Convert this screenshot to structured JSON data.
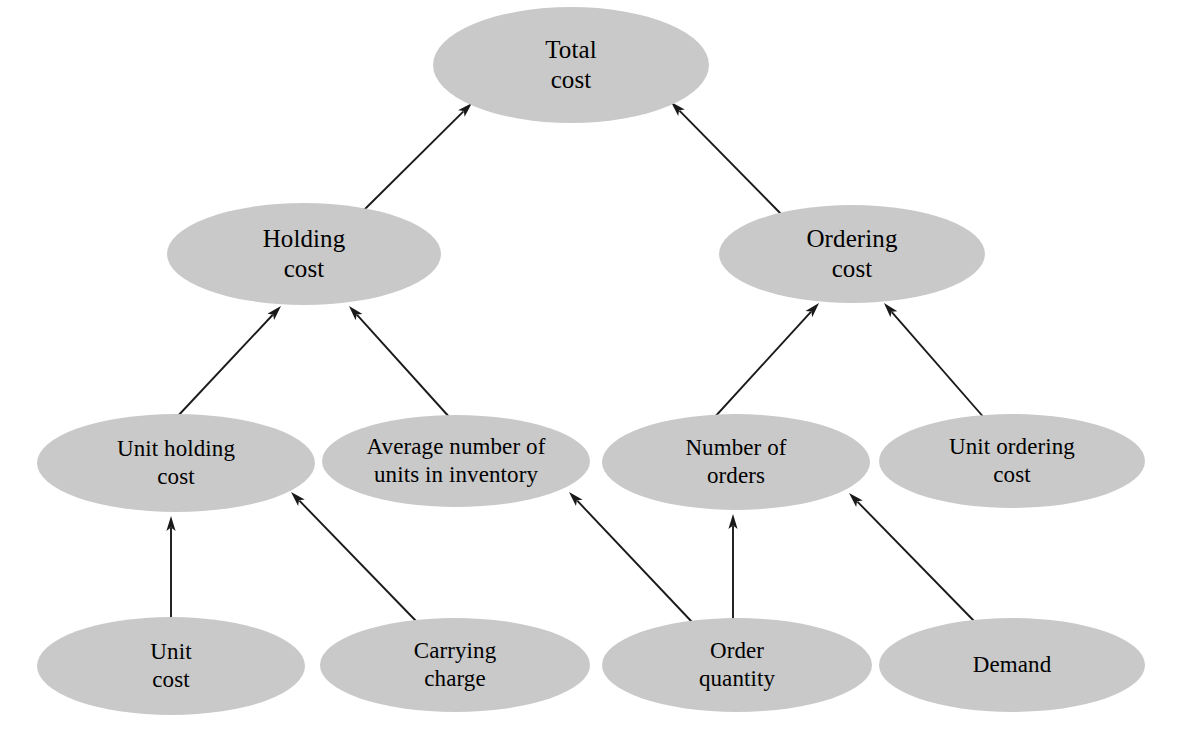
{
  "diagram": {
    "type": "hierarchy-tree",
    "node_fill_color": "#c9c9c9",
    "edge_color": "#1a1a1a",
    "background_color": "#ffffff",
    "nodes": [
      {
        "id": "total-cost",
        "label": "Total\ncost",
        "level": 0,
        "cx": 571,
        "cy": 65,
        "rx": 138,
        "ry": 58,
        "font_size": 25
      },
      {
        "id": "holding-cost",
        "label": "Holding\ncost",
        "level": 1,
        "cx": 304,
        "cy": 254,
        "rx": 137,
        "ry": 51,
        "font_size": 25
      },
      {
        "id": "ordering-cost",
        "label": "Ordering\ncost",
        "level": 1,
        "cx": 852,
        "cy": 254,
        "rx": 133,
        "ry": 49,
        "font_size": 25
      },
      {
        "id": "unit-holding-cost",
        "label": "Unit holding\ncost",
        "level": 2,
        "cx": 176,
        "cy": 463,
        "rx": 139,
        "ry": 49,
        "font_size": 23
      },
      {
        "id": "average-units-inventory",
        "label": "Average number of\nunits in inventory",
        "level": 2,
        "cx": 456,
        "cy": 461,
        "rx": 134,
        "ry": 46,
        "font_size": 23
      },
      {
        "id": "number-of-orders",
        "label": "Number of\norders",
        "level": 2,
        "cx": 736,
        "cy": 462,
        "rx": 134,
        "ry": 48,
        "font_size": 23
      },
      {
        "id": "unit-ordering-cost",
        "label": "Unit ordering\ncost",
        "level": 2,
        "cx": 1012,
        "cy": 461,
        "rx": 133,
        "ry": 47,
        "font_size": 23
      },
      {
        "id": "unit-cost",
        "label": "Unit\ncost",
        "level": 3,
        "cx": 171,
        "cy": 666,
        "rx": 134,
        "ry": 49,
        "font_size": 23
      },
      {
        "id": "carrying-charge",
        "label": "Carrying\ncharge",
        "level": 3,
        "cx": 455,
        "cy": 665,
        "rx": 135,
        "ry": 47,
        "font_size": 23
      },
      {
        "id": "order-quantity",
        "label": "Order\nquantity",
        "level": 3,
        "cx": 737,
        "cy": 665,
        "rx": 135,
        "ry": 47,
        "font_size": 23
      },
      {
        "id": "demand",
        "label": "Demand",
        "level": 3,
        "cx": 1012,
        "cy": 665,
        "rx": 133,
        "ry": 47,
        "font_size": 23
      }
    ],
    "edges": [
      {
        "id": "edge-holding-to-total",
        "from": "holding-cost",
        "to": "total-cost",
        "x1": 362,
        "y1": 212,
        "x2": 472,
        "y2": 103
      },
      {
        "id": "edge-ordering-to-total",
        "from": "ordering-cost",
        "to": "total-cost",
        "x1": 782,
        "y1": 215,
        "x2": 671,
        "y2": 102
      },
      {
        "id": "edge-unitholding-to-holding",
        "from": "unit-holding-cost",
        "to": "holding-cost",
        "x1": 176,
        "y1": 418,
        "x2": 281,
        "y2": 306
      },
      {
        "id": "edge-avgunits-to-holding",
        "from": "average-units-inventory",
        "to": "holding-cost",
        "x1": 451,
        "y1": 419,
        "x2": 349,
        "y2": 306
      },
      {
        "id": "edge-numorders-to-ordering",
        "from": "number-of-orders",
        "to": "ordering-cost",
        "x1": 713,
        "y1": 419,
        "x2": 819,
        "y2": 303
      },
      {
        "id": "edge-unitordering-to-ordering",
        "from": "unit-ordering-cost",
        "to": "ordering-cost",
        "x1": 986,
        "y1": 420,
        "x2": 884,
        "y2": 303
      },
      {
        "id": "edge-unitcost-to-unitholding",
        "from": "unit-cost",
        "to": "unit-holding-cost",
        "x1": 171,
        "y1": 621,
        "x2": 171,
        "y2": 516
      },
      {
        "id": "edge-carrying-to-unitholding",
        "from": "carrying-charge",
        "to": "unit-holding-cost",
        "x1": 416,
        "y1": 621,
        "x2": 291,
        "y2": 492
      },
      {
        "id": "edge-orderqty-to-avgunits",
        "from": "order-quantity",
        "to": "average-units-inventory",
        "x1": 692,
        "y1": 622,
        "x2": 569,
        "y2": 492
      },
      {
        "id": "edge-orderqty-to-numorders",
        "from": "order-quantity",
        "to": "number-of-orders",
        "x1": 733,
        "y1": 620,
        "x2": 733,
        "y2": 514
      },
      {
        "id": "edge-demand-to-numorders",
        "from": "demand",
        "to": "number-of-orders",
        "x1": 975,
        "y1": 622,
        "x2": 849,
        "y2": 493
      }
    ]
  }
}
